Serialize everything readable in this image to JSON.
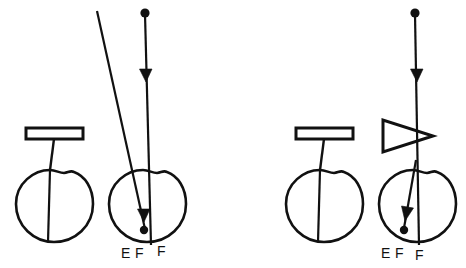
{
  "figure": {
    "background_color": "#ffffff",
    "ink_color": "#111111",
    "width": 466,
    "height": 268
  },
  "panels": [
    {
      "id": "panel-left",
      "name": "left-panel",
      "optical_element": {
        "type": "plate",
        "shape_name": "rectangle-plate",
        "label": ""
      },
      "eyes": [
        {
          "id": "eye-left-a",
          "name": "unaided-eye",
          "has_rays": false
        },
        {
          "id": "eye-left-b",
          "name": "ray-traced-eye",
          "has_rays": true
        }
      ],
      "rays": [
        {
          "id": "ray-left-vertical",
          "name": "vertical-ray",
          "head": "arrowhead-down",
          "origin_marker": "dot"
        },
        {
          "id": "ray-left-oblique",
          "name": "oblique-ray",
          "head": "none",
          "origin_marker": "none"
        }
      ],
      "labels": [
        {
          "id": "label-left-E",
          "text": "E",
          "name": "label-e"
        },
        {
          "id": "label-left-F1",
          "text": "F",
          "name": "label-f-near"
        },
        {
          "id": "label-left-F2",
          "text": "F",
          "name": "label-f-far"
        }
      ]
    },
    {
      "id": "panel-right",
      "name": "right-panel",
      "optical_element": {
        "type": "plate-and-prism",
        "shape_name": "rectangle-plate-with-triangular-prism",
        "label": ""
      },
      "eyes": [
        {
          "id": "eye-right-a",
          "name": "unaided-eye",
          "has_rays": false
        },
        {
          "id": "eye-right-b",
          "name": "ray-traced-eye",
          "has_rays": true
        }
      ],
      "rays": [
        {
          "id": "ray-right-vertical",
          "name": "vertical-ray",
          "head": "arrowhead-down",
          "origin_marker": "dot"
        },
        {
          "id": "ray-right-deviated",
          "name": "deviated-ray",
          "head": "arrowhead-down",
          "origin_marker": "none"
        }
      ],
      "labels": [
        {
          "id": "label-right-E",
          "text": "E",
          "name": "label-e"
        },
        {
          "id": "label-right-F1",
          "text": "F",
          "name": "label-f-near"
        },
        {
          "id": "label-right-F2",
          "text": "F",
          "name": "label-f-far"
        }
      ]
    }
  ]
}
